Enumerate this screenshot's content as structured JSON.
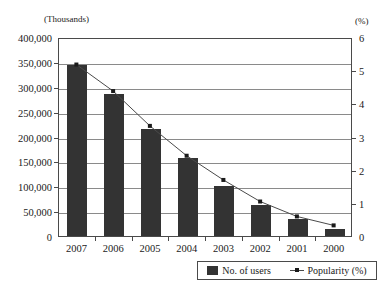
{
  "chart_data": {
    "type": "bar",
    "title": "",
    "xlabel": "",
    "categories": [
      "2007",
      "2006",
      "2005",
      "2004",
      "2003",
      "2002",
      "2001",
      "2000"
    ],
    "series": [
      {
        "name": "No. of users",
        "type": "bar",
        "axis": "left",
        "color": "#333333",
        "values": [
          343000,
          285000,
          215000,
          156000,
          101000,
          63000,
          35000,
          14000
        ]
      },
      {
        "name": "Popularity (%)",
        "type": "line",
        "axis": "right",
        "color": "#4a4a4a",
        "values": [
          5.2,
          4.4,
          3.35,
          2.45,
          1.72,
          1.07,
          0.62,
          0.35
        ]
      }
    ],
    "left_axis": {
      "unit_label": "(Thousands)",
      "ylabel": "",
      "ylim": [
        0,
        400000
      ],
      "ticks": [
        0,
        50000,
        100000,
        150000,
        200000,
        250000,
        300000,
        350000,
        400000
      ],
      "tick_labels": [
        "0",
        "50,000",
        "100,000",
        "150,000",
        "200,000",
        "250,000",
        "300,000",
        "350,000",
        "400,000"
      ]
    },
    "right_axis": {
      "unit_label": "(%)",
      "ylabel": "",
      "ylim": [
        0,
        6
      ],
      "ticks": [
        0,
        1,
        2,
        3,
        4,
        5,
        6
      ],
      "tick_labels": [
        "0",
        "1",
        "2",
        "3",
        "4",
        "5",
        "6"
      ]
    },
    "grid": true,
    "legend_position": "bottom-right",
    "legend": [
      {
        "label": "No. of users",
        "marker": "bar-swatch"
      },
      {
        "label": "Popularity (%)",
        "marker": "line-with-point"
      }
    ]
  }
}
